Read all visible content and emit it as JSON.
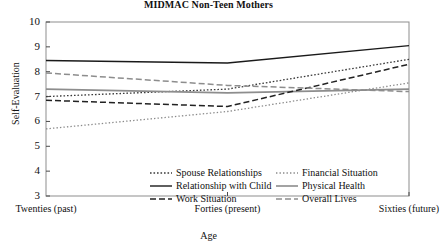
{
  "chart_data": {
    "type": "line",
    "title": "MIDMAC Non-Teen Mothers",
    "xlabel": "Age",
    "ylabel": "Self-Evaluation",
    "categories": [
      "Twenties (past)",
      "Forties (present)",
      "Sixties (future)"
    ],
    "ylim": [
      3,
      10
    ],
    "yticks": [
      3,
      4,
      5,
      6,
      7,
      8,
      9,
      10
    ],
    "grid": false,
    "legend_position": "bottom-inside",
    "series": [
      {
        "name": "Spouse Relationships",
        "values": [
          7.0,
          7.3,
          8.5
        ],
        "style": "dotted",
        "color": "#3a3a3a"
      },
      {
        "name": "Financial Situation",
        "values": [
          5.7,
          6.4,
          7.55
        ],
        "style": "fine-dotted",
        "color": "#8a8a8a"
      },
      {
        "name": "Relationship with Child",
        "values": [
          8.45,
          8.35,
          9.05
        ],
        "style": "solid",
        "color": "#1a1a1a"
      },
      {
        "name": "Physical Health",
        "values": [
          7.3,
          7.15,
          7.3
        ],
        "style": "solid-gray",
        "color": "#8d8d8d"
      },
      {
        "name": "Work Situation",
        "values": [
          6.85,
          6.6,
          8.3
        ],
        "style": "dashed",
        "color": "#222222"
      },
      {
        "name": "Overall Lives",
        "values": [
          7.95,
          7.45,
          7.2
        ],
        "style": "dashed-gray",
        "color": "#8d8d8d"
      }
    ]
  },
  "axis": {
    "y_tick_labels": [
      "10",
      "9",
      "8",
      "7",
      "6",
      "5",
      "4",
      "3"
    ],
    "x_tick_labels": [
      "Twenties (past)",
      "Forties (present)",
      "Sixties (future)"
    ]
  },
  "legend": {
    "items": [
      {
        "label": "Spouse Relationships",
        "style": "dotted"
      },
      {
        "label": "Financial Situation",
        "style": "fine-dotted"
      },
      {
        "label": "Relationship with Child",
        "style": "solid"
      },
      {
        "label": "Physical Health",
        "style": "solid-gray"
      },
      {
        "label": "Work Situation",
        "style": "dashed"
      },
      {
        "label": "Overall Lives",
        "style": "dashed-gray"
      }
    ]
  }
}
